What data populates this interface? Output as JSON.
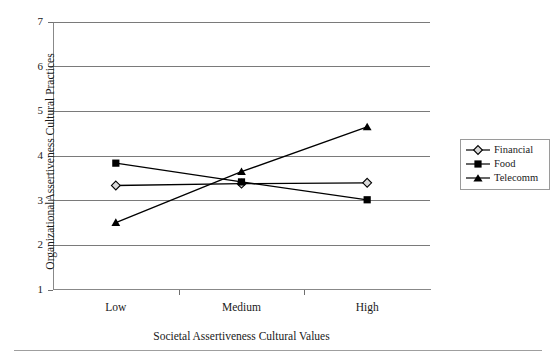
{
  "chart_data": {
    "type": "line",
    "title": "",
    "subtitle": "",
    "xlabel": "Societal Assertiveness Cultural Values",
    "ylabel": "OrganizationalAssertiveness Cultural Practices",
    "categories": [
      "Low",
      "Medium",
      "High"
    ],
    "ylim": [
      1,
      7
    ],
    "yticks": [
      1,
      2,
      3,
      4,
      5,
      6,
      7
    ],
    "ytick_labels": [
      "1",
      "2",
      "3",
      "4",
      "5",
      "6",
      "7"
    ],
    "grid": true,
    "grid_axis": "y",
    "legend_position": "right",
    "series": [
      {
        "name": "Financial",
        "marker": "diamond-open",
        "color": "#000000",
        "values": [
          3.34,
          3.38,
          3.4
        ]
      },
      {
        "name": "Food",
        "marker": "square-filled",
        "color": "#000000",
        "values": [
          3.84,
          3.42,
          3.02
        ]
      },
      {
        "name": "Telecomm",
        "marker": "triangle-filled",
        "color": "#000000",
        "values": [
          2.51,
          3.65,
          4.65
        ]
      }
    ]
  },
  "axis": {
    "y_label": "OrganizationalAssertiveness Cultural Practices",
    "x_label": "Societal Assertiveness Cultural Values",
    "y_ticks": [
      "7",
      "6",
      "5",
      "4",
      "3",
      "2",
      "1"
    ],
    "x_ticks": [
      "Low",
      "Medium",
      "High"
    ]
  },
  "legend": {
    "items": [
      {
        "label": "Financial",
        "marker": "diamond-open-icon"
      },
      {
        "label": "Food",
        "marker": "square-filled-icon"
      },
      {
        "label": "Telecomm",
        "marker": "triangle-filled-icon"
      }
    ]
  }
}
